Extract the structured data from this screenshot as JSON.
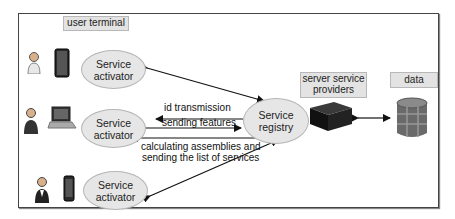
{
  "diagram": {
    "labels": {
      "user_terminal": "user terminal",
      "server_service_providers_line1": "server service",
      "server_service_providers_line2": "providers",
      "data": "data"
    },
    "nodes": {
      "activator_top": {
        "line1": "Service",
        "line2": "activator"
      },
      "activator_middle": {
        "line1": "Service",
        "line2": "activator"
      },
      "activator_bottom": {
        "line1": "Service",
        "line2": "activator"
      },
      "registry": {
        "line1": "Service",
        "line2": "registry"
      }
    },
    "edges": {
      "id_transmission": "id transmission",
      "sending_features": "sending features",
      "calculating_line1": "calculating assemblies and",
      "calculating_line2": "sending the list of services"
    },
    "icons": {
      "user_top": "female-user-icon",
      "device_top": "tablet-icon",
      "user_middle": "male-user-icon",
      "device_middle": "laptop-icon",
      "user_bottom": "female-user-icon",
      "device_bottom": "smartphone-icon",
      "server": "server-icon",
      "database": "database-icon"
    },
    "colors": {
      "ellipse_fill": "#e6e6e6",
      "label_fill": "#e3e3e3",
      "frame": "#444444"
    }
  }
}
